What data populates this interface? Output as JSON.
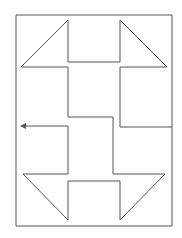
{
  "diagram": {
    "title": "",
    "type": "line-drawing",
    "colors": {
      "background": "#ffffff",
      "stroke": "#555555"
    },
    "frame": {
      "points": "172,15 16,15 16,226 172,226 172,127 120,127 120,181 68,181 68,220"
    },
    "top_shape": {
      "points": "68,20 21,67 68,67 68,117 113,117 113,174 165,174 120,220 120,181"
    },
    "top_notch": {
      "points": "68,20 68,62 120,62 120,20 167,67 120,67 120,127"
    },
    "left_loop": {
      "points": "68,126 23,126 23,126"
    },
    "arrow": {
      "points": "68,126 23,126",
      "label": ""
    },
    "left_bracket": {
      "points": "68,126 68,173 23,173 68,220"
    }
  }
}
